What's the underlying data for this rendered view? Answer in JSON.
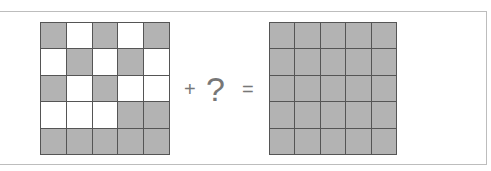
{
  "puzzle": {
    "left_grid": [
      [
        1,
        0,
        1,
        0,
        1
      ],
      [
        0,
        1,
        0,
        1,
        0
      ],
      [
        1,
        0,
        1,
        0,
        0
      ],
      [
        0,
        0,
        0,
        1,
        1
      ],
      [
        1,
        1,
        1,
        1,
        1
      ]
    ],
    "right_grid": [
      [
        1,
        1,
        1,
        1,
        1
      ],
      [
        1,
        1,
        1,
        1,
        1
      ],
      [
        1,
        1,
        1,
        1,
        1
      ],
      [
        1,
        1,
        1,
        1,
        1
      ],
      [
        1,
        1,
        1,
        1,
        1
      ]
    ],
    "plus": "+",
    "question": "?",
    "equals": "=",
    "colors": {
      "filled": "#b3b3b3",
      "empty": "#ffffff",
      "line": "#555555"
    }
  }
}
